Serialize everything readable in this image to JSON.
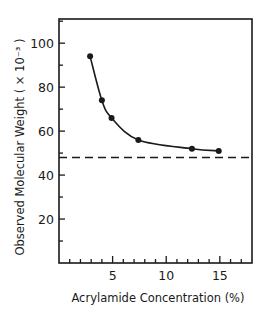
{
  "chart_data": {
    "type": "line",
    "title": "",
    "xlabel": "Acrylamide Concentration (%)",
    "ylabel": "Observed Molecular Weight ( × 10⁻³ )",
    "xlim": [
      0,
      18
    ],
    "ylim": [
      0,
      111
    ],
    "x_ticks_major": [
      5,
      10,
      15
    ],
    "x_ticks_minor_step": 1,
    "y_ticks_major": [
      20,
      40,
      60,
      80,
      100
    ],
    "y_ticks_minor_step": 10,
    "grid": false,
    "legend": null,
    "series": [
      {
        "name": "Observed molecular weight",
        "style": "markers with smooth fitted curve",
        "x": [
          2.9,
          4.0,
          4.9,
          7.4,
          12.4,
          14.9
        ],
        "y": [
          94,
          74,
          66,
          56,
          52,
          51
        ]
      }
    ],
    "reference_lines": [
      {
        "orientation": "horizontal",
        "y": 48,
        "style": "dashed"
      }
    ],
    "colors": {
      "line": "#1a1a1a",
      "marker": "#1a1a1a",
      "axis": "#1a1a1a",
      "background": "#ffffff"
    }
  }
}
